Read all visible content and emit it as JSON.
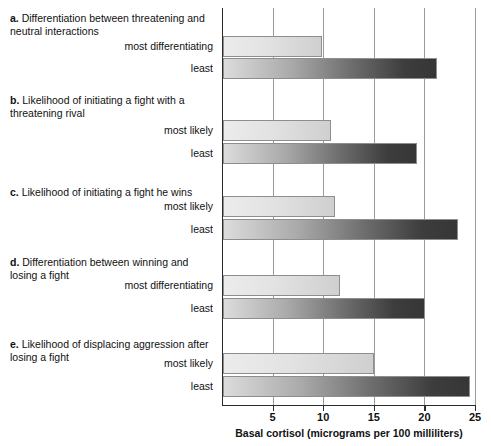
{
  "chart_data": {
    "type": "bar",
    "orientation": "horizontal",
    "title": "",
    "xlabel": "Basal cortisol (micrograms per 100 milliliters)",
    "ylabel": "",
    "xlim": [
      0,
      25
    ],
    "xticks": [
      5,
      10,
      15,
      20,
      25
    ],
    "xtick_labels": [
      "5",
      "10",
      "15",
      "20",
      "25"
    ],
    "grid": true,
    "legend": "none",
    "groups": [
      {
        "letter": "a.",
        "title": "Differentiation between threatening and neutral interactions",
        "bars": [
          {
            "label": "most differentiating",
            "value": 9.9,
            "shade": "light"
          },
          {
            "label": "least",
            "value": 21.2,
            "shade": "dark"
          }
        ]
      },
      {
        "letter": "b.",
        "title": "Likelihood of initiating a fight with a threatening rival",
        "bars": [
          {
            "label": "most likely",
            "value": 10.8,
            "shade": "light"
          },
          {
            "label": "least",
            "value": 19.3,
            "shade": "dark"
          }
        ]
      },
      {
        "letter": "c.",
        "title": "Likelihood of initiating a fight he wins",
        "bars": [
          {
            "label": "most likely",
            "value": 11.2,
            "shade": "light"
          },
          {
            "label": "least",
            "value": 23.3,
            "shade": "dark"
          }
        ]
      },
      {
        "letter": "d.",
        "title": "Differentiation between winning and losing a fight",
        "bars": [
          {
            "label": "most differentiating",
            "value": 11.7,
            "shade": "light"
          },
          {
            "label": "least",
            "value": 20.1,
            "shade": "dark"
          }
        ]
      },
      {
        "letter": "e.",
        "title": "Likelihood of displacing aggression after losing a fight",
        "bars": [
          {
            "label": "most likely",
            "value": 15.0,
            "shade": "light"
          },
          {
            "label": "least",
            "value": 24.5,
            "shade": "dark"
          }
        ]
      }
    ],
    "colors": {
      "axis": "#2b2b2b",
      "gridline": "#9a9a9a",
      "bar_light_start": "#ececec",
      "bar_light_end": "#cfcfcf",
      "bar_dark_start": "#dcdcdc",
      "bar_dark_end": "#363636",
      "text": "#111111",
      "background": "#ffffff"
    }
  }
}
